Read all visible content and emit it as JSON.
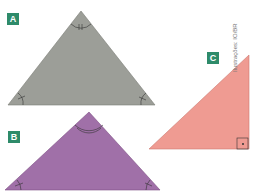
{
  "figures": [
    {
      "label": "A",
      "shape": "isosceles-triangle",
      "fill": "#9c9e98"
    },
    {
      "label": "B",
      "shape": "obtuse-isosceles-triangle",
      "fill": "#a070a8"
    },
    {
      "label": "C",
      "shape": "right-triangle",
      "fill": "#ef9b92"
    }
  ],
  "credit": "Ilustrações: IO/BR",
  "colors": {
    "badge": "#2e8b6a"
  }
}
